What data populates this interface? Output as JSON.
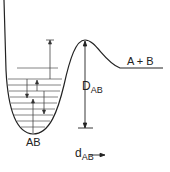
{
  "diagram": {
    "labels": {
      "products": "A + B",
      "molecule": "AB",
      "dissociation_energy_main": "D",
      "dissociation_energy_sub": "AB",
      "distance_main": "d",
      "distance_sub": "AB"
    },
    "colors": {
      "curve": "#222222",
      "levels": "#555555",
      "background": "#ffffff"
    },
    "energy_levels_y": [
      68,
      79,
      85,
      91,
      97,
      103,
      109,
      115,
      121,
      127
    ],
    "transitions": [
      {
        "x": 50,
        "from_y": 68,
        "to_y": 40,
        "direction": "up",
        "cap": "bar"
      },
      {
        "x": 37,
        "from_y": 91,
        "to_y": 79,
        "direction": "up"
      },
      {
        "x": 27,
        "from_y": 79,
        "to_y": 97,
        "direction": "down"
      },
      {
        "x": 33,
        "from_y": 127,
        "to_y": 100,
        "direction": "up"
      },
      {
        "x": 44,
        "from_y": 91,
        "to_y": 113,
        "direction": "down"
      }
    ]
  }
}
